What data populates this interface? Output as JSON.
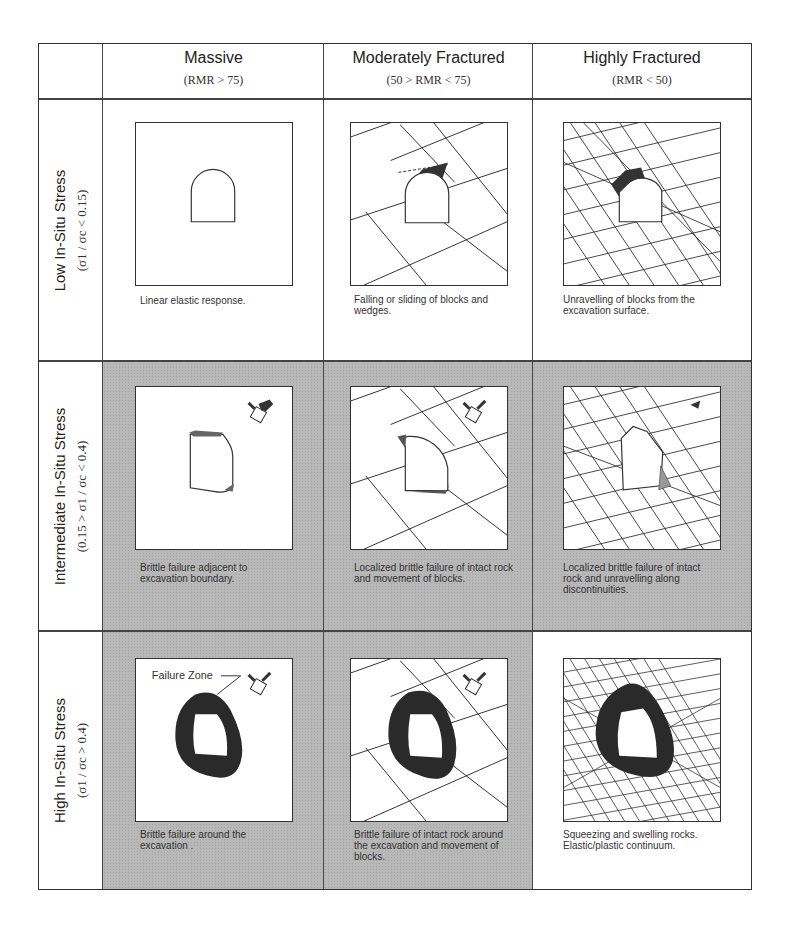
{
  "columns": [
    {
      "title": "Massive",
      "condition": "(RMR > 75)"
    },
    {
      "title": "Moderately Fractured",
      "condition": "(50 > RMR < 75)"
    },
    {
      "title": "Highly Fractured",
      "condition": "(RMR < 50)"
    }
  ],
  "rows": [
    {
      "title": "Low In-Situ Stress",
      "condition": "(σ1 / σc < 0.15)"
    },
    {
      "title": "Intermediate In-Situ Stress",
      "condition": "(0.15 > σ1 / σc < 0.4)"
    },
    {
      "title": "High In-Situ Stress",
      "condition": "(σ1 / σc > 0.4)"
    }
  ],
  "cells": [
    [
      "Linear elastic response.",
      "Falling or sliding of blocks and wedges.",
      "Unravelling of blocks from the excavation surface."
    ],
    [
      "Brittle failure adjacent to excavation boundary.",
      "Localized brittle failure of intact rock and movement of blocks.",
      "Localized brittle failure of intact rock and unravelling along discontinuities."
    ],
    [
      "Brittle failure around the excavation .",
      "Brittle failure of intact rock around the excavation and movement of blocks.",
      "Squeezing and swelling rocks. Elastic/plastic continuum."
    ]
  ],
  "annotations": {
    "failure_zone_label": "Failure Zone"
  },
  "colors": {
    "shaded_cell": "#b8b8b8",
    "failure_zone": "#2a2a2a",
    "line": "#333333"
  }
}
